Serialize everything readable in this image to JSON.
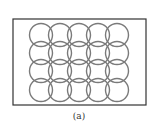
{
  "figure": {
    "caption": "(a)",
    "frame": {
      "x": 13,
      "y": 19,
      "width": 133,
      "height": 86,
      "stroke": "#333333"
    },
    "grid": {
      "columns": 5,
      "rows": 4,
      "col_centers": [
        41,
        60,
        79,
        98,
        117
      ],
      "row_centers": [
        35,
        53,
        71,
        90
      ],
      "radius": 11.5,
      "stroke": "#7a7a7a"
    }
  }
}
